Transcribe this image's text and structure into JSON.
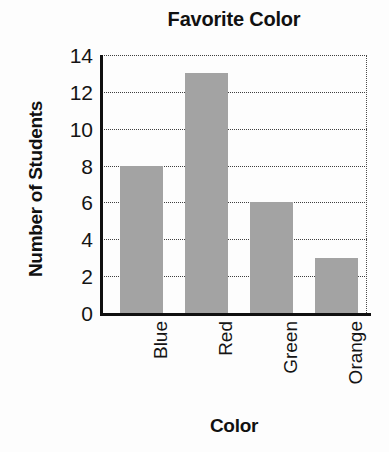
{
  "chart_data": {
    "type": "bar",
    "title": "Favorite Color",
    "xlabel": "Color",
    "ylabel": "Number of Students",
    "categories": [
      "Blue",
      "Red",
      "Green",
      "Orange"
    ],
    "values": [
      8,
      13,
      6,
      3
    ],
    "ylim": [
      0,
      14
    ],
    "ytick_labels": [
      "14",
      "12",
      "10",
      "8",
      "6",
      "4",
      "2",
      "0"
    ],
    "ytick_values": [
      14,
      12,
      10,
      8,
      6,
      4,
      2,
      0
    ],
    "ytick_step": 2,
    "grid": true,
    "grid_axis": "y",
    "grid_style": "dotted",
    "legend": false,
    "xtick_label_rotation": 90,
    "bar_color": "#a3a3a3",
    "axis_color": "#101010",
    "background_color": "#fdfdfd"
  }
}
